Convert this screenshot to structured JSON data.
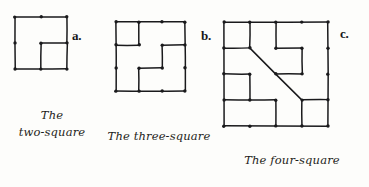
{
  "plate": {
    "width": 369,
    "height": 187,
    "background_color": "#fdfdfb",
    "ink_color": "#1a1a1c"
  },
  "figures": [
    {
      "id": "two-square",
      "label": "a.",
      "caption_lines": [
        "The",
        "two-square"
      ],
      "grid": 3,
      "origin": [
        15,
        17
      ],
      "cell": 26,
      "label_pos": [
        72,
        28
      ],
      "dots": [
        [
          0,
          0
        ],
        [
          1,
          0
        ],
        [
          2,
          0
        ],
        [
          0,
          1
        ],
        [
          1,
          1
        ],
        [
          2,
          1
        ],
        [
          0,
          2
        ],
        [
          1,
          2
        ],
        [
          2,
          2
        ]
      ],
      "edges": [
        [
          [
            0,
            0
          ],
          [
            2,
            0
          ]
        ],
        [
          [
            0,
            0
          ],
          [
            0,
            2
          ]
        ],
        [
          [
            0,
            2
          ],
          [
            2,
            2
          ]
        ],
        [
          [
            2,
            0
          ],
          [
            2,
            1
          ]
        ],
        [
          [
            2,
            1
          ],
          [
            2,
            2
          ]
        ],
        [
          [
            1,
            1
          ],
          [
            2,
            1
          ]
        ],
        [
          [
            1,
            1
          ],
          [
            1,
            2
          ]
        ]
      ]
    },
    {
      "id": "three-square",
      "label": "b.",
      "caption_lines": [
        "The three-square"
      ],
      "grid": 4,
      "origin": [
        116,
        22
      ],
      "cell": 23,
      "label_pos": [
        201,
        28
      ],
      "dots": [
        [
          0,
          0
        ],
        [
          1,
          0
        ],
        [
          2,
          0
        ],
        [
          3,
          0
        ],
        [
          0,
          1
        ],
        [
          1,
          1
        ],
        [
          2,
          1
        ],
        [
          3,
          1
        ],
        [
          0,
          2
        ],
        [
          1,
          2
        ],
        [
          2,
          2
        ],
        [
          3,
          2
        ],
        [
          0,
          3
        ],
        [
          1,
          3
        ],
        [
          2,
          3
        ],
        [
          3,
          3
        ]
      ],
      "edges": [
        [
          [
            0,
            0
          ],
          [
            3,
            0
          ]
        ],
        [
          [
            0,
            0
          ],
          [
            0,
            3
          ]
        ],
        [
          [
            0,
            3
          ],
          [
            3,
            3
          ]
        ],
        [
          [
            3,
            0
          ],
          [
            3,
            3
          ]
        ],
        [
          [
            1,
            0
          ],
          [
            1,
            1
          ]
        ],
        [
          [
            0,
            1
          ],
          [
            1,
            1
          ]
        ],
        [
          [
            2,
            1
          ],
          [
            3,
            1
          ]
        ],
        [
          [
            2,
            1
          ],
          [
            2,
            2
          ]
        ],
        [
          [
            1,
            2
          ],
          [
            2,
            2
          ]
        ],
        [
          [
            1,
            2
          ],
          [
            1,
            3
          ]
        ]
      ]
    },
    {
      "id": "four-square",
      "label": "c.",
      "caption_lines": [
        "The four-square"
      ],
      "grid": 5,
      "origin": [
        224,
        22
      ],
      "cell": 26,
      "label_pos": [
        340,
        26
      ],
      "dots": [
        [
          0,
          0
        ],
        [
          1,
          0
        ],
        [
          2,
          0
        ],
        [
          3,
          0
        ],
        [
          4,
          0
        ],
        [
          0,
          1
        ],
        [
          1,
          1
        ],
        [
          2,
          1
        ],
        [
          3,
          1
        ],
        [
          4,
          1
        ],
        [
          0,
          2
        ],
        [
          1,
          2
        ],
        [
          2,
          2
        ],
        [
          3,
          2
        ],
        [
          4,
          2
        ],
        [
          0,
          3
        ],
        [
          1,
          3
        ],
        [
          2,
          3
        ],
        [
          3,
          3
        ],
        [
          4,
          3
        ],
        [
          0,
          4
        ],
        [
          1,
          4
        ],
        [
          2,
          4
        ],
        [
          3,
          4
        ],
        [
          4,
          4
        ]
      ],
      "edges": [
        [
          [
            0,
            0
          ],
          [
            4,
            0
          ]
        ],
        [
          [
            0,
            0
          ],
          [
            0,
            4
          ]
        ],
        [
          [
            0,
            4
          ],
          [
            4,
            4
          ]
        ],
        [
          [
            4,
            0
          ],
          [
            4,
            4
          ]
        ],
        [
          [
            1,
            0
          ],
          [
            1,
            1
          ]
        ],
        [
          [
            0,
            1
          ],
          [
            1,
            1
          ]
        ],
        [
          [
            2,
            0
          ],
          [
            2,
            1
          ]
        ],
        [
          [
            2,
            1
          ],
          [
            3,
            1
          ]
        ],
        [
          [
            3,
            1
          ],
          [
            3,
            2
          ]
        ],
        [
          [
            2,
            2
          ],
          [
            3,
            2
          ]
        ],
        [
          [
            0,
            2
          ],
          [
            1,
            2
          ]
        ],
        [
          [
            1,
            2
          ],
          [
            1,
            3
          ]
        ],
        [
          [
            0,
            3
          ],
          [
            2,
            3
          ]
        ],
        [
          [
            2,
            3
          ],
          [
            2,
            4
          ]
        ],
        [
          [
            3,
            3
          ],
          [
            4,
            3
          ]
        ],
        [
          [
            3,
            3
          ],
          [
            3,
            4
          ]
        ]
      ],
      "diagonal": [
        [
          1,
          1
        ],
        [
          3,
          3
        ]
      ]
    }
  ]
}
